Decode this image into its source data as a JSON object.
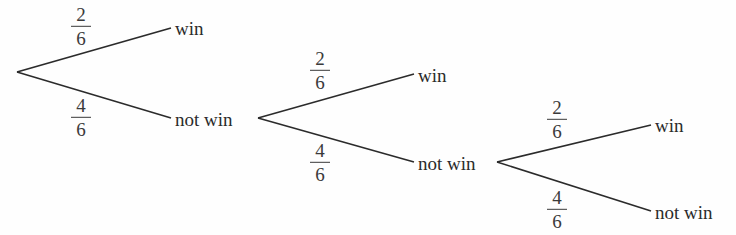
{
  "diagram": {
    "type": "probability-tree",
    "levels": 3,
    "nodes": {
      "root": {
        "x": 17,
        "y": 72
      },
      "l1_win": {
        "label": "win",
        "x": 175,
        "y": 28,
        "end_x": 171
      },
      "l1_notwin": {
        "label": "not win",
        "x": 175,
        "y": 118,
        "end_x": 171,
        "branch_x": 258
      },
      "l2_win": {
        "label": "win",
        "x": 418,
        "y": 74,
        "end_x": 414
      },
      "l2_notwin": {
        "label": "not win",
        "x": 418,
        "y": 162,
        "end_x": 414,
        "branch_x": 497
      },
      "l3_win": {
        "label": "win",
        "x": 655,
        "y": 125,
        "end_x": 651
      },
      "l3_notwin": {
        "label": "not win",
        "x": 655,
        "y": 211,
        "end_x": 651
      }
    },
    "branches": [
      {
        "id": "l1_up",
        "from": "root",
        "to": "l1_win",
        "prob": {
          "num": "2",
          "den": "6"
        },
        "label_pos": {
          "x": 81,
          "y": 27
        }
      },
      {
        "id": "l1_down",
        "from": "root",
        "to": "l1_notwin",
        "prob": {
          "num": "4",
          "den": "6"
        },
        "label_pos": {
          "x": 81,
          "y": 118
        }
      },
      {
        "id": "l2_up",
        "from": "l1_notwin",
        "to": "l2_win",
        "prob": {
          "num": "2",
          "den": "6"
        },
        "label_pos": {
          "x": 320,
          "y": 71
        }
      },
      {
        "id": "l2_down",
        "from": "l1_notwin",
        "to": "l2_notwin",
        "prob": {
          "num": "4",
          "den": "6"
        },
        "label_pos": {
          "x": 320,
          "y": 163
        }
      },
      {
        "id": "l3_up",
        "from": "l2_notwin",
        "to": "l3_win",
        "prob": {
          "num": "2",
          "den": "6"
        },
        "label_pos": {
          "x": 557,
          "y": 120
        }
      },
      {
        "id": "l3_down",
        "from": "l2_notwin",
        "to": "l3_notwin",
        "prob": {
          "num": "4",
          "den": "6"
        },
        "label_pos": {
          "x": 557,
          "y": 210
        }
      }
    ],
    "labels": {
      "l1_win": "win",
      "l1_notwin": "not win",
      "l2_win": "win",
      "l2_notwin": "not win",
      "l3_win": "win",
      "l3_notwin": "not win"
    },
    "probs": {
      "l1_up": {
        "num": "2",
        "den": "6"
      },
      "l1_down": {
        "num": "4",
        "den": "6"
      },
      "l2_up": {
        "num": "2",
        "den": "6"
      },
      "l2_down": {
        "num": "4",
        "den": "6"
      },
      "l3_up": {
        "num": "2",
        "den": "6"
      },
      "l3_down": {
        "num": "4",
        "den": "6"
      }
    },
    "colors": {
      "line": "#2b2b2b",
      "text": "#2a2a2a",
      "background": "#fefefe"
    }
  }
}
